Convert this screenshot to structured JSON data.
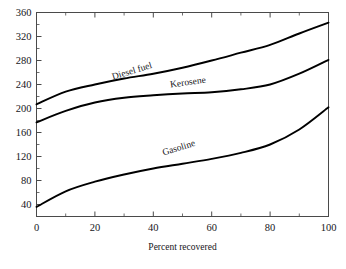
{
  "chart_data": {
    "type": "line",
    "title": "",
    "subtitle": "",
    "xlabel": "Percent recovered",
    "ylabel": "",
    "xlim": [
      0,
      100
    ],
    "ylim": [
      20,
      360
    ],
    "grid": false,
    "legend": "inline-curve-labels",
    "x_ticks": [
      0,
      20,
      40,
      60,
      80,
      100
    ],
    "x_ticks_minor": [
      10,
      30,
      50,
      70,
      90
    ],
    "y_ticks": [
      40,
      80,
      120,
      160,
      200,
      240,
      280,
      320,
      360
    ],
    "y_ticks_minor": [
      60,
      100,
      140,
      180,
      220,
      260,
      300,
      340
    ],
    "x": [
      0,
      10,
      20,
      30,
      40,
      50,
      60,
      70,
      80,
      90,
      100
    ],
    "series": [
      {
        "name": "Diesel fuel",
        "label": "Diesel fuel",
        "color": "#000000",
        "values": [
          207,
          228,
          240,
          250,
          258,
          268,
          280,
          293,
          306,
          325,
          343
        ]
      },
      {
        "name": "Kerosene",
        "label": "Kerosene",
        "color": "#000000",
        "values": [
          177,
          196,
          210,
          218,
          222,
          225,
          227,
          232,
          240,
          258,
          281
        ]
      },
      {
        "name": "Gasoline",
        "label": "Gasoline",
        "color": "#000000",
        "values": [
          36,
          62,
          78,
          90,
          100,
          108,
          116,
          126,
          140,
          165,
          202
        ]
      }
    ],
    "annotations": [
      {
        "text": "Diesel fuel",
        "x": 33,
        "y": 258,
        "rotation": -17
      },
      {
        "text": "Kerosene",
        "x": 52,
        "y": 239,
        "rotation": -8
      },
      {
        "text": "Gasoline",
        "x": 49,
        "y": 130,
        "rotation": -17
      }
    ]
  },
  "axes": {
    "x_title": "Percent recovered",
    "x_tick_labels": [
      "0",
      "20",
      "40",
      "60",
      "80",
      "100"
    ],
    "y_tick_labels": [
      "40",
      "80",
      "120",
      "160",
      "200",
      "240",
      "280",
      "320",
      "360"
    ]
  },
  "colors": {
    "curve": "#000000",
    "frame": "#4a4a4a",
    "text": "#16161a",
    "background": "#ffffff"
  }
}
